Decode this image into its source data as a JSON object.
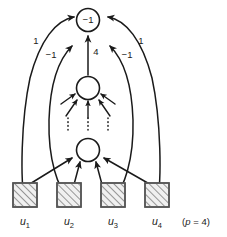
{
  "figure": {
    "type": "neural-network-diagram",
    "caption": "(p = 4)",
    "caption_parts": {
      "open": "(",
      "symbol": "p",
      "relation": " = ",
      "value": "4",
      "close": ")"
    },
    "colors": {
      "stroke": "#1a1a1a",
      "box_fill": "#f0f0f0",
      "box_stroke": "#555555",
      "hatch": "#4a4a4a",
      "background": "#ffffff"
    }
  },
  "nodes": {
    "output": {
      "label": "−1",
      "cx": 88,
      "cy": 20,
      "r": 11.5
    },
    "hidden_upper": {
      "label": "",
      "cx": 88,
      "cy": 88,
      "r": 11.5
    },
    "hidden_lower": {
      "label": "",
      "cx": 88,
      "cy": 150,
      "r": 11.5
    }
  },
  "edges": [
    {
      "id": "edge-left-outer",
      "from": "u1",
      "to": "output",
      "weight": "1",
      "weight_x": 36,
      "weight_y": 41
    },
    {
      "id": "edge-left-inner",
      "from": "u2",
      "to": "hidden-upper-region",
      "weight": "−1",
      "weight_x": 51,
      "weight_y": 55
    },
    {
      "id": "edge-center-vertical",
      "from": "hidden_upper",
      "to": "output",
      "weight": "4",
      "weight_x": 96,
      "weight_y": 52
    },
    {
      "id": "edge-right-inner",
      "from": "u3",
      "to": "hidden-upper-region",
      "weight": "−1",
      "weight_x": 127,
      "weight_y": 55
    },
    {
      "id": "edge-right-outer",
      "from": "u4",
      "to": "output",
      "weight": "1",
      "weight_x": 141,
      "weight_y": 41
    }
  ],
  "input_units": [
    {
      "name": "u1",
      "symbol": "u",
      "subscript": "1",
      "box_x": 13,
      "box_y": 183,
      "box_w": 24,
      "box_h": 24,
      "label_x": 25,
      "label_y": 225
    },
    {
      "name": "u2",
      "symbol": "u",
      "subscript": "2",
      "box_x": 57,
      "box_y": 183,
      "box_w": 24,
      "box_h": 24,
      "label_x": 69,
      "label_y": 225
    },
    {
      "name": "u3",
      "symbol": "u",
      "subscript": "3",
      "box_x": 101,
      "box_y": 183,
      "box_w": 24,
      "box_h": 24,
      "label_x": 113,
      "label_y": 225
    },
    {
      "name": "u4",
      "symbol": "u",
      "subscript": "4",
      "box_x": 145,
      "box_y": 183,
      "box_w": 24,
      "box_h": 24,
      "label_x": 157,
      "label_y": 225
    }
  ],
  "caption_position": {
    "x": 196,
    "y": 225
  }
}
